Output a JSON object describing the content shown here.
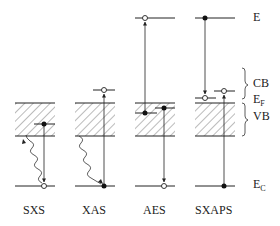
{
  "diagram": {
    "type": "energy-level-diagram",
    "columns": [
      {
        "id": "sxs",
        "label": "SXS"
      },
      {
        "id": "xas",
        "label": "XAS"
      },
      {
        "id": "aes",
        "label": "AES"
      },
      {
        "id": "sxaps",
        "label": "SXAPS"
      }
    ],
    "levels": {
      "E": {
        "label": "E"
      },
      "CB": {
        "label": "CB"
      },
      "EF": {
        "label": "E",
        "sub": "F"
      },
      "VB": {
        "label": "VB"
      },
      "EC": {
        "label": "E",
        "sub": "C"
      }
    }
  }
}
